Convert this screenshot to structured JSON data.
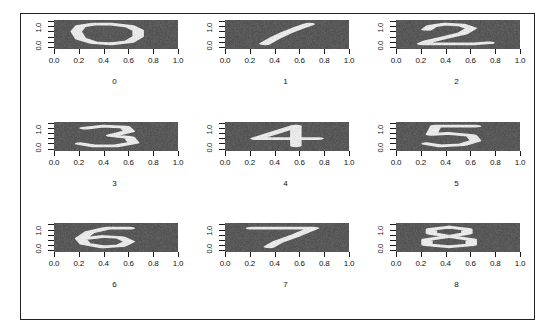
{
  "figure": {
    "type": "image-grid",
    "rows": 3,
    "cols": 3,
    "background_color": "#ffffff",
    "frame_color": "#222222",
    "raster_bg_color": "#585858",
    "raster_stroke_color": "#e8e8e8"
  },
  "axes": {
    "x_label": "",
    "y_label": "",
    "x_ticks": [
      "0.0",
      "0.2",
      "0.4",
      "0.6",
      "0.8",
      "1.0"
    ],
    "x_tick_values": [
      0.0,
      0.2,
      0.4,
      0.6,
      0.8,
      1.0
    ],
    "x_lim": [
      0.0,
      1.0
    ],
    "y_ticks": [
      "0.0",
      "1.0"
    ],
    "y_tick_values": [
      0.0,
      1.0
    ],
    "y_minor_tick_count": 6,
    "y_lim": [
      0.0,
      1.0
    ],
    "y_label_rotation": -90,
    "grid": false
  },
  "chart_data": {
    "type": "heatmap",
    "title": "",
    "xlabel": "",
    "ylabel": "",
    "xlim": [
      0.0,
      1.0
    ],
    "ylim": [
      0.0,
      1.0
    ],
    "grid": false,
    "legend": "none",
    "categories": [
      "0",
      "1",
      "2",
      "3",
      "4",
      "5",
      "6",
      "7",
      "8"
    ],
    "values": [
      0,
      1,
      2,
      3,
      4,
      5,
      6,
      7,
      8
    ],
    "panels": [
      {
        "label": "0",
        "digit": 0,
        "row": 0,
        "col": 0,
        "x_ticks": [
          "0.0",
          "0.2",
          "0.4",
          "0.6",
          "0.8",
          "1.0"
        ],
        "y_ticks": [
          "0.0",
          "1.0"
        ]
      },
      {
        "label": "1",
        "digit": 1,
        "row": 0,
        "col": 1,
        "x_ticks": [
          "0.0",
          "0.2",
          "0.4",
          "0.6",
          "0.8",
          "1.0"
        ],
        "y_ticks": [
          "0.0",
          "1.0"
        ]
      },
      {
        "label": "2",
        "digit": 2,
        "row": 0,
        "col": 2,
        "x_ticks": [
          "0.0",
          "0.2",
          "0.4",
          "0.6",
          "0.8",
          "1.0"
        ],
        "y_ticks": [
          "0.0",
          "1.0"
        ]
      },
      {
        "label": "3",
        "digit": 3,
        "row": 1,
        "col": 0,
        "x_ticks": [
          "0.0",
          "0.2",
          "0.4",
          "0.6",
          "0.8",
          "1.0"
        ],
        "y_ticks": [
          "0.0",
          "1.0"
        ]
      },
      {
        "label": "4",
        "digit": 4,
        "row": 1,
        "col": 1,
        "x_ticks": [
          "0.0",
          "0.2",
          "0.4",
          "0.6",
          "0.8",
          "1.0"
        ],
        "y_ticks": [
          "0.0",
          "1.0"
        ]
      },
      {
        "label": "5",
        "digit": 5,
        "row": 1,
        "col": 2,
        "x_ticks": [
          "0.0",
          "0.2",
          "0.4",
          "0.6",
          "0.8",
          "1.0"
        ],
        "y_ticks": [
          "0.0",
          "1.0"
        ]
      },
      {
        "label": "6",
        "digit": 6,
        "row": 2,
        "col": 0,
        "x_ticks": [
          "0.0",
          "0.2",
          "0.4",
          "0.6",
          "0.8",
          "1.0"
        ],
        "y_ticks": [
          "0.0",
          "1.0"
        ]
      },
      {
        "label": "7",
        "digit": 7,
        "row": 2,
        "col": 1,
        "x_ticks": [
          "0.0",
          "0.2",
          "0.4",
          "0.6",
          "0.8",
          "1.0"
        ],
        "y_ticks": [
          "0.0",
          "1.0"
        ]
      },
      {
        "label": "8",
        "digit": 8,
        "row": 2,
        "col": 2,
        "x_ticks": [
          "0.0",
          "0.2",
          "0.4",
          "0.6",
          "0.8",
          "1.0"
        ],
        "y_ticks": [
          "0.0",
          "1.0"
        ]
      }
    ]
  }
}
